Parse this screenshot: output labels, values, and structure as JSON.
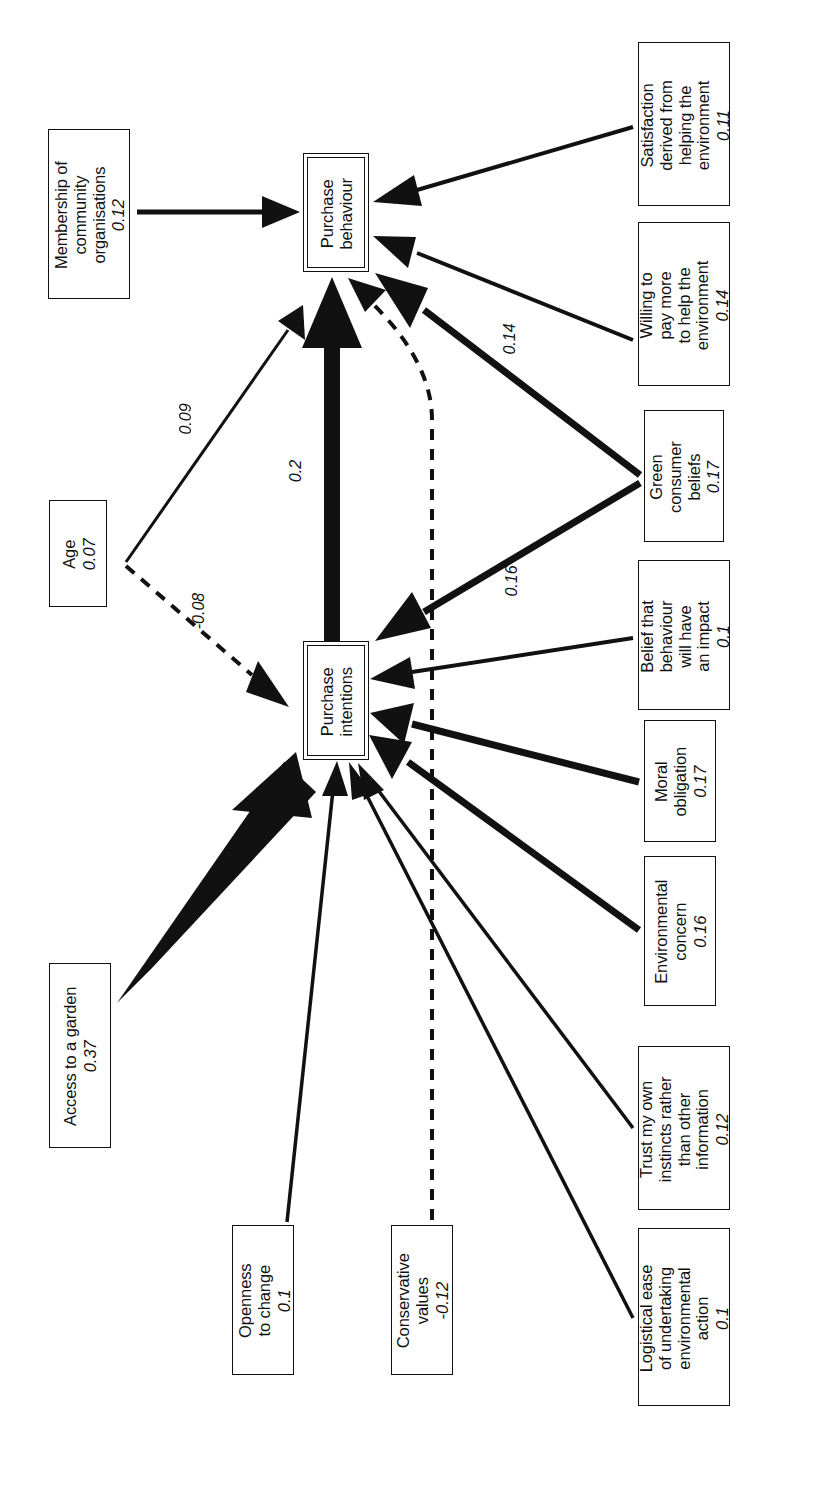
{
  "diagram": {
    "orientation": "rotated-90-ccw",
    "background": "#ffffff",
    "line_color": "#111111"
  },
  "nodes": [
    {
      "id": "purchase_behaviour",
      "lines": [
        "Purchase",
        "behaviour"
      ],
      "coef": "",
      "endogenous": true,
      "x": 303,
      "y": 153,
      "w": 66,
      "h": 119
    },
    {
      "id": "purchase_intentions",
      "lines": [
        "Purchase",
        "intentions"
      ],
      "coef": "",
      "endogenous": true,
      "x": 303,
      "y": 641,
      "w": 66,
      "h": 119
    },
    {
      "id": "membership_community",
      "lines": [
        "Membership of",
        "community",
        "organisations"
      ],
      "coef": "0.12",
      "x": 48,
      "y": 129,
      "w": 82,
      "h": 170
    },
    {
      "id": "age",
      "lines": [
        "Age"
      ],
      "coef": "0.07",
      "x": 49,
      "y": 500,
      "w": 58,
      "h": 107
    },
    {
      "id": "access_garden",
      "lines": [
        "Access to a garden"
      ],
      "coef": "0.37",
      "x": 49,
      "y": 963,
      "w": 62,
      "h": 185
    },
    {
      "id": "openness_change",
      "lines": [
        "Openness",
        "to change"
      ],
      "coef": "0.1",
      "x": 232,
      "y": 1225,
      "w": 62,
      "h": 150
    },
    {
      "id": "conservative_values",
      "lines": [
        "Conservative",
        "values"
      ],
      "coef": "-0.12",
      "x": 391,
      "y": 1225,
      "w": 62,
      "h": 150
    },
    {
      "id": "satisfaction_helping",
      "lines": [
        "Satisfaction",
        "derived from",
        "helping the",
        "environment"
      ],
      "coef": "0.11",
      "x": 638,
      "y": 42,
      "w": 92,
      "h": 164
    },
    {
      "id": "willing_pay_more",
      "lines": [
        "Willing to",
        "pay more",
        "to help the",
        "environment"
      ],
      "coef": "0.14",
      "x": 638,
      "y": 222,
      "w": 92,
      "h": 164
    },
    {
      "id": "green_consumer",
      "lines": [
        "Green",
        "consumer",
        "beliefs"
      ],
      "coef": "0.17",
      "x": 644,
      "y": 410,
      "w": 80,
      "h": 132
    },
    {
      "id": "belief_impact",
      "lines": [
        "Belief that",
        "behaviour",
        "will have",
        "an impact"
      ],
      "coef": "0.1",
      "x": 638,
      "y": 560,
      "w": 92,
      "h": 150
    },
    {
      "id": "moral_obligation",
      "lines": [
        "Moral",
        "obligation"
      ],
      "coef": "0.17",
      "x": 644,
      "y": 720,
      "w": 72,
      "h": 122
    },
    {
      "id": "environmental_concern",
      "lines": [
        "Environmental",
        "concern"
      ],
      "coef": "0.16",
      "x": 644,
      "y": 856,
      "w": 72,
      "h": 150
    },
    {
      "id": "trust_own_instincts",
      "lines": [
        "Trust my own",
        "instincts rather",
        "than other",
        "information"
      ],
      "coef": "0.12",
      "x": 638,
      "y": 1046,
      "w": 92,
      "h": 164
    },
    {
      "id": "logistical_ease",
      "lines": [
        "Logistical ease",
        "of undertaking",
        "environmental",
        "action"
      ],
      "coef": "0.1",
      "x": 638,
      "y": 1228,
      "w": 92,
      "h": 178
    }
  ],
  "edges": [
    {
      "id": "e_membership_to_behaviour",
      "from": "membership_community",
      "to": "purchase_behaviour",
      "label": "",
      "weight": "0.12",
      "style": "solid",
      "thickness": 5
    },
    {
      "id": "e_satisfaction_to_behaviour",
      "from": "satisfaction_helping",
      "to": "purchase_behaviour",
      "label": "",
      "weight": "0.11",
      "style": "solid",
      "thickness": 4
    },
    {
      "id": "e_willing_to_behaviour",
      "from": "willing_pay_more",
      "to": "purchase_behaviour",
      "label": "",
      "weight": "0.14",
      "style": "solid",
      "thickness": 4
    },
    {
      "id": "e_green_to_behaviour",
      "from": "green_consumer",
      "to": "purchase_behaviour",
      "label": "0.14",
      "weight": "0.14",
      "style": "solid",
      "thickness": 7
    },
    {
      "id": "e_green_to_intentions",
      "from": "green_consumer",
      "to": "purchase_intentions",
      "label": "0.16",
      "weight": "0.16",
      "style": "solid",
      "thickness": 7
    },
    {
      "id": "e_age_to_behaviour",
      "from": "age",
      "to": "purchase_behaviour",
      "label": "0.09",
      "weight": "0.09",
      "style": "solid",
      "thickness": 3
    },
    {
      "id": "e_age_to_intentions",
      "from": "age",
      "to": "purchase_intentions",
      "label": "-0.08",
      "weight": "-0.08",
      "style": "dashed",
      "thickness": 4
    },
    {
      "id": "e_intentions_to_behaviour",
      "from": "purchase_intentions",
      "to": "purchase_behaviour",
      "label": "0.2",
      "weight": "0.2",
      "style": "solid",
      "thickness": 16
    },
    {
      "id": "e_conservative_to_behaviour",
      "from": "conservative_values",
      "to": "purchase_behaviour",
      "label": "",
      "weight": "-0.12",
      "style": "dashed",
      "thickness": 4
    },
    {
      "id": "e_belief_to_intentions",
      "from": "belief_impact",
      "to": "purchase_intentions",
      "label": "",
      "weight": "0.1",
      "style": "solid",
      "thickness": 4
    },
    {
      "id": "e_moral_to_intentions",
      "from": "moral_obligation",
      "to": "purchase_intentions",
      "label": "",
      "weight": "0.17",
      "style": "solid",
      "thickness": 7
    },
    {
      "id": "e_envconcern_to_intentions",
      "from": "environmental_concern",
      "to": "purchase_intentions",
      "label": "",
      "weight": "0.16",
      "style": "solid",
      "thickness": 7
    },
    {
      "id": "e_trust_to_intentions",
      "from": "trust_own_instincts",
      "to": "purchase_intentions",
      "label": "",
      "weight": "0.12",
      "style": "solid",
      "thickness": 3.5
    },
    {
      "id": "e_logistical_to_intentions",
      "from": "logistical_ease",
      "to": "purchase_intentions",
      "label": "",
      "weight": "0.1",
      "style": "solid",
      "thickness": 3.5
    },
    {
      "id": "e_garden_to_intentions",
      "from": "access_garden",
      "to": "purchase_intentions",
      "label": "",
      "weight": "0.37",
      "style": "solid",
      "thickness": 20
    },
    {
      "id": "e_openness_to_intentions",
      "from": "openness_change",
      "to": "purchase_intentions",
      "label": "",
      "weight": "0.1",
      "style": "solid",
      "thickness": 3.5
    }
  ],
  "edge_labels": [
    {
      "id": "label_009",
      "text": "0.09",
      "x": 186,
      "y": 418
    },
    {
      "id": "label_02",
      "text": "0.2",
      "x": 292,
      "y": 470
    },
    {
      "id": "label_minus008",
      "text": "-0.08",
      "x": 198,
      "y": 610
    },
    {
      "id": "label_014",
      "text": "0.14",
      "x": 508,
      "y": 338
    },
    {
      "id": "label_016",
      "text": "0.16",
      "x": 510,
      "y": 580
    }
  ]
}
